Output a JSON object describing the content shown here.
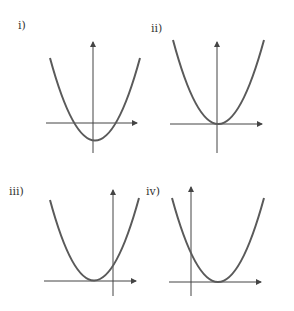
{
  "figure": {
    "curve_color": "#5a5a5a",
    "axis_color": "#444444",
    "panels": [
      {
        "label": "i)",
        "description": "Upward parabola, vertex below x-axis slightly right of y-axis; two x-intercepts"
      },
      {
        "label": "ii)",
        "description": "Upward parabola, vertex at the origin"
      },
      {
        "label": "iii)",
        "description": "Upward parabola, vertex on x-axis left of y-axis; positive y-intercept"
      },
      {
        "label": "iv)",
        "description": "Upward parabola, vertex on x-axis right of y-axis; positive y-intercept"
      }
    ]
  }
}
